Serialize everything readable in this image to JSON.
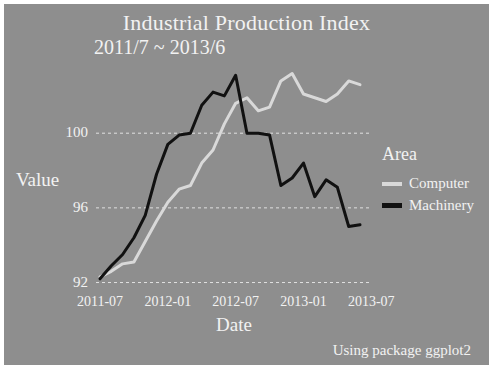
{
  "chart_data": {
    "type": "line",
    "title": "Industrial Production Index",
    "subtitle": "2011/7 ~ 2013/6",
    "caption": "Using package ggplot2",
    "xlabel": "Date",
    "ylabel": "Value",
    "legend_title": "Area",
    "legend_position": "right",
    "grid": true,
    "panel_background": "#8e8e8e",
    "text_color": "#f2f2f2",
    "gridline_color": "#f0f0f0",
    "ylim": [
      91.6,
      103.6
    ],
    "y_ticks": [
      92,
      96,
      100
    ],
    "x_ticks": [
      "2011-07",
      "2012-01",
      "2012-07",
      "2013-01",
      "2013-07"
    ],
    "x": [
      "2011-07",
      "2011-08",
      "2011-09",
      "2011-10",
      "2011-11",
      "2011-12",
      "2012-01",
      "2012-02",
      "2012-03",
      "2012-04",
      "2012-05",
      "2012-06",
      "2012-07",
      "2012-08",
      "2012-09",
      "2012-10",
      "2012-11",
      "2012-12",
      "2013-01",
      "2013-02",
      "2013-03",
      "2013-04",
      "2013-05",
      "2013-06"
    ],
    "series": [
      {
        "name": "Computer",
        "color": "#d9d9d9",
        "stroke_width": 3,
        "values": [
          92.3,
          92.6,
          93.0,
          93.1,
          94.2,
          95.3,
          96.3,
          97.0,
          97.2,
          98.4,
          99.1,
          100.5,
          101.6,
          101.9,
          101.2,
          101.4,
          102.8,
          103.2,
          102.1,
          101.9,
          101.7,
          102.1,
          102.8,
          102.6
        ]
      },
      {
        "name": "Machinery",
        "color": "#111111",
        "stroke_width": 3,
        "values": [
          92.2,
          92.9,
          93.5,
          94.4,
          95.6,
          97.8,
          99.4,
          99.9,
          100.0,
          101.5,
          102.2,
          102.0,
          103.1,
          100.0,
          100.0,
          99.9,
          97.2,
          97.6,
          98.4,
          96.6,
          97.5,
          97.1,
          95.0,
          95.1
        ]
      }
    ]
  },
  "legend": {
    "title": "Area",
    "entries": [
      {
        "label": "Computer",
        "color": "#d9d9d9"
      },
      {
        "label": "Machinery",
        "color": "#111111"
      }
    ]
  },
  "axes": {
    "y_title": "Value",
    "x_title": "Date",
    "y_tick_labels": [
      "100",
      "96",
      "92"
    ],
    "x_tick_labels": [
      "2011-07",
      "2012-01",
      "2012-07",
      "2013-01",
      "2013-07"
    ]
  },
  "header": {
    "title": "Industrial Production Index",
    "subtitle": "2011/7 ~ 2013/6"
  },
  "footer": {
    "caption": "Using package ggplot2"
  }
}
